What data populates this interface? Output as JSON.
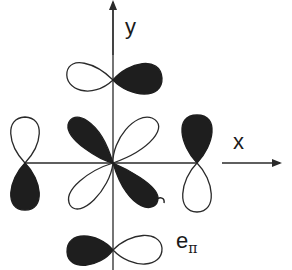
{
  "diagram": {
    "axes": {
      "x_label": "x",
      "y_label": "y"
    },
    "symmetry_label": {
      "main": "e",
      "subscript": "π"
    },
    "colors": {
      "filled_lobe": "#1e1e1e",
      "open_lobe": "#ffffff",
      "line": "#2a2a2a"
    },
    "orbitals": [
      {
        "name": "top-p-orbital",
        "position": "top",
        "orientation": "horizontal",
        "filled": "right"
      },
      {
        "name": "bottom-p-orbital",
        "position": "bottom",
        "orientation": "horizontal",
        "filled": "left"
      },
      {
        "name": "left-p-orbital",
        "position": "left",
        "orientation": "vertical",
        "filled": "bottom"
      },
      {
        "name": "right-p-orbital",
        "position": "right",
        "orientation": "vertical",
        "filled": "top"
      },
      {
        "name": "central-d-orbital",
        "position": "center",
        "orientation": "diagonal",
        "filled": "upper-left,lower-right"
      }
    ]
  }
}
